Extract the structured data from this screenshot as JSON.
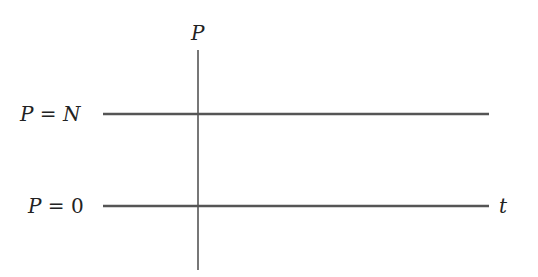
{
  "diagram": {
    "title": "",
    "axis": {
      "vertical_label": "P",
      "horizontal_label": "t"
    },
    "lines": [
      {
        "label_var": "P",
        "label_eq": " = ",
        "label_val": "N",
        "label_val_italic": true,
        "y": 114
      },
      {
        "label_var": "P",
        "label_eq": " = ",
        "label_val": "0",
        "label_val_italic": false,
        "y": 206
      }
    ],
    "colors": {
      "line": "#555555",
      "text": "#222222",
      "background": "#ffffff"
    }
  }
}
